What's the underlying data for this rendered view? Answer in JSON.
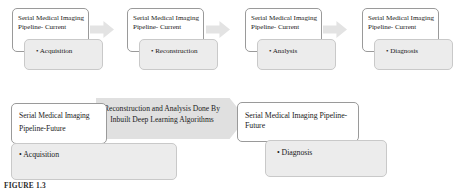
{
  "figure": {
    "caption": "FIGURE 1.3"
  },
  "colors": {
    "box_fill_white": "#ffffff",
    "box_fill_gray": "#ececec",
    "box_border": "#9a9a9a",
    "arrow_small": "#e3e3e3",
    "arrow_large": "#e0e0e0",
    "text": "#1b1b1b"
  },
  "top_row": {
    "stages": [
      {
        "title": "Serial Medical Imaging Pipeline- Current",
        "step_label": "• Acquisition",
        "arrow_after": true
      },
      {
        "title": "Serial Medical Imaging Pipeline- Current",
        "step_label": "• Reconstruction",
        "arrow_after": true
      },
      {
        "title": "Serial Medical Imaging Pipeline- Current",
        "step_label": "• Analysis",
        "arrow_after": true
      },
      {
        "title": "Serial Medical Imaging Pipeline- Current",
        "step_label": "• Diagnosis",
        "arrow_after": false
      }
    ]
  },
  "bottom_row": {
    "start": {
      "title": "Serial Medical Imaging Pipeline-Future",
      "step_label": "• Acquisition"
    },
    "arrow": {
      "label": "Reconstruction and Analysis Done By Inbuilt Deep Learning Algorithms"
    },
    "end": {
      "title": "Serial Medical Imaging Pipeline- Future",
      "step_label": "• Diagnosis"
    }
  }
}
